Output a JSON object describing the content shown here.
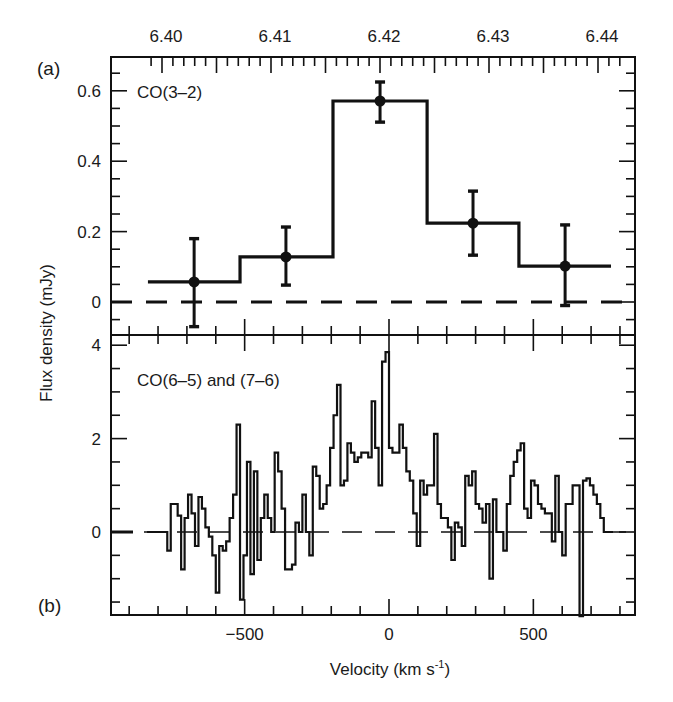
{
  "figure": {
    "panel_a_label": "(a)",
    "panel_b_label": "(b)",
    "y_axis_label": "Flux density (mJy)",
    "x_axis_label_main": "Velocity (km s",
    "x_axis_label_sup": "-1",
    "x_axis_label_close": ")"
  },
  "chart_data": [
    {
      "type": "line",
      "style": "step-histogram with error bars",
      "panel": "(a)",
      "title": "CO(3–2)",
      "xlabel": "Velocity (km s^-1)",
      "x2label": "",
      "ylabel": "Flux density (mJy)",
      "xlim": [
        -965,
        852
      ],
      "ylim": [
        -0.094,
        0.7
      ],
      "top_axis": {
        "tick_labels": [
          "6.40",
          "6.41",
          "6.42",
          "6.43",
          "6.44"
        ],
        "tick_values": [
          6.4,
          6.41,
          6.42,
          6.43,
          6.44
        ]
      },
      "yticks": [
        0,
        0.2,
        0.4,
        0.6
      ],
      "ytick_labels": [
        "0",
        "0.2",
        "0.4",
        "0.6"
      ],
      "bins": [
        {
          "v_lo": -835,
          "v_hi": -516,
          "v_center": -675,
          "flux": 0.057,
          "err_lo": -0.07,
          "err_hi": 0.18
        },
        {
          "v_lo": -516,
          "v_hi": -194,
          "v_center": -357,
          "flux": 0.128,
          "err_lo": 0.048,
          "err_hi": 0.213
        },
        {
          "v_lo": -194,
          "v_hi": 132,
          "v_center": -31,
          "flux": 0.571,
          "err_lo": 0.511,
          "err_hi": 0.625
        },
        {
          "v_lo": 132,
          "v_hi": 450,
          "v_center": 291,
          "flux": 0.224,
          "err_lo": 0.133,
          "err_hi": 0.315
        },
        {
          "v_lo": 450,
          "v_hi": 769,
          "v_center": 610,
          "flux": 0.102,
          "err_lo": -0.01,
          "err_hi": 0.219
        }
      ],
      "zero_line": {
        "y": 0,
        "style": "dashed"
      },
      "grid": false,
      "legend": null
    },
    {
      "type": "line",
      "style": "step-histogram",
      "panel": "(b)",
      "title": "CO(6–5) and (7–6)",
      "xlabel": "Velocity (km s^-1)",
      "ylabel": "Flux density (mJy)",
      "xlim": [
        -965,
        852
      ],
      "ylim": [
        -1.8,
        4.2
      ],
      "xticks": [
        -500,
        0,
        500
      ],
      "xtick_labels": [
        "-500",
        "0",
        "500"
      ],
      "yticks": [
        0,
        2,
        4
      ],
      "ytick_labels": [
        "0",
        "2",
        "4"
      ],
      "channel_width": 12,
      "v_start": -768,
      "flux": [
        -0.4,
        0.6,
        0.6,
        0.35,
        -0.8,
        0.3,
        0.8,
        0.4,
        -0.3,
        0.75,
        0.5,
        0.1,
        -0.1,
        -0.5,
        -1.3,
        -0.3,
        -0.4,
        -0.2,
        0.3,
        0.8,
        2.3,
        -1.45,
        -0.5,
        1.5,
        -0.9,
        1.3,
        -0.6,
        0.3,
        0.8,
        0.3,
        0.0,
        1.7,
        1.3,
        0.5,
        -0.8,
        -0.8,
        -0.7,
        0.2,
        0.0,
        0.8,
        0.0,
        -0.5,
        1.4,
        1.2,
        0.5,
        0.6,
        1.0,
        1.8,
        2.5,
        3.15,
        1.0,
        1.1,
        1.9,
        1.7,
        1.5,
        1.6,
        1.7,
        1.7,
        1.6,
        2.8,
        1.8,
        1.0,
        3.65,
        3.85,
        1.8,
        1.7,
        1.7,
        2.3,
        1.8,
        1.3,
        1.1,
        0.4,
        -0.3,
        1.1,
        0.8,
        1.0,
        1.0,
        2.1,
        0.6,
        0.3,
        0.3,
        0.1,
        -0.6,
        0.2,
        0.1,
        -0.3,
        1.2,
        1.0,
        1.3,
        0.6,
        0.5,
        0.2,
        0.6,
        -1.0,
        0.7,
        0.0,
        0.0,
        -0.4,
        0.6,
        1.2,
        1.5,
        1.75,
        1.9,
        0.5,
        0.3,
        1.1,
        1.0,
        0.6,
        0.5,
        0.4,
        0.4,
        -0.2,
        1.2,
        0.0,
        -0.5,
        0.6,
        0.6,
        1.0,
        1.0,
        -1.8,
        1.1,
        1.15,
        1.0,
        0.8,
        0.6,
        0.3,
        0.0
      ],
      "zero_line": {
        "y": 0,
        "style": "dashed"
      },
      "grid": false,
      "legend": null
    }
  ]
}
